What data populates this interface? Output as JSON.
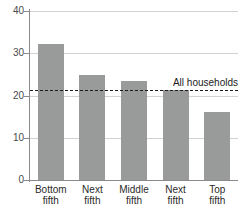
{
  "chart_data": {
    "type": "bar",
    "title": "",
    "subtitle": "",
    "xlabel": "",
    "ylabel": "",
    "categories": [
      {
        "line1": "Bottom",
        "line2": "fifth"
      },
      {
        "line1": "Next",
        "line2": "fifth"
      },
      {
        "line1": "Middle",
        "line2": "fifth"
      },
      {
        "line1": "Next",
        "line2": "fifth"
      },
      {
        "line1": "Top",
        "line2": "fifth"
      }
    ],
    "category_labels": [
      "Bottom fifth",
      "Next fifth",
      "Middle fifth",
      "Next fifth",
      "Top fifth"
    ],
    "values": [
      32.2,
      24.8,
      23.5,
      21.3,
      16.1
    ],
    "ylim": [
      0,
      40
    ],
    "ytick_labels": [
      "0",
      "10",
      "20",
      "30",
      "40"
    ],
    "ytick_values": [
      0,
      10,
      20,
      30,
      40
    ],
    "grid": true,
    "grid_axis": "y",
    "legend": "none",
    "bar_color": "#999a9a",
    "grid_color": "#d2d2d2",
    "axis_color": "#8a8a8a",
    "annotations": [
      {
        "name": "all-households-reference",
        "label": "All households",
        "value": 21.4,
        "style": "dashed",
        "color": "#1c1c1c"
      }
    ]
  }
}
